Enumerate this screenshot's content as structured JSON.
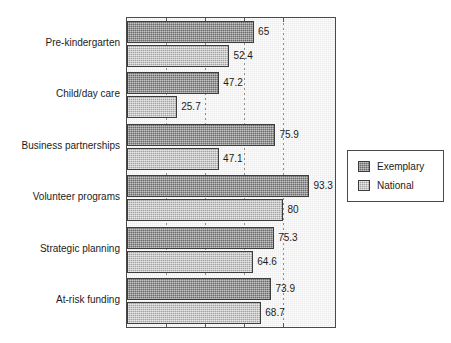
{
  "chart_data": {
    "type": "bar",
    "orientation": "horizontal",
    "title": "",
    "subtitle": "",
    "xlabel": "",
    "ylabel": "",
    "xlim": [
      0,
      100
    ],
    "grid": true,
    "gridlines": [
      20,
      40,
      60,
      80
    ],
    "tick_labels": [],
    "legend_position": "right",
    "categories": [
      "Pre-kindergarten",
      "Child/day care",
      "Business partnerships",
      "Volunteer programs",
      "Strategic planning",
      "At-risk funding"
    ],
    "series": [
      {
        "name": "Exemplary",
        "color": "#858585",
        "values": [
          65,
          47.2,
          75.9,
          93.3,
          75.3,
          73.9
        ],
        "labels": [
          "65",
          "47.2",
          "75.9",
          "93.3",
          "75.3",
          "73.9"
        ]
      },
      {
        "name": "National",
        "color": "#bcbcbc",
        "values": [
          52.4,
          25.7,
          47.1,
          80,
          64.6,
          68.7
        ],
        "labels": [
          "52.4",
          "25.7",
          "47.1",
          "80",
          "64.6",
          "68.7"
        ]
      }
    ]
  },
  "legend": {
    "entries": [
      {
        "label": "Exemplary",
        "swatch": "exemplary"
      },
      {
        "label": "National",
        "swatch": "national"
      }
    ]
  },
  "colors": {
    "plot_background": "#ececec",
    "frame": "#4a4a4a",
    "exemplary": "#858585",
    "national": "#bcbcbc",
    "text": "#1c1c1c",
    "gridline": "#8d8d8d"
  }
}
